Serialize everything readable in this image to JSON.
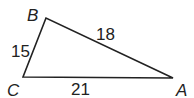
{
  "diagram": {
    "type": "triangle",
    "stroke_color": "#222222",
    "vertices": [
      {
        "name": "B",
        "label": "B",
        "x": 46,
        "y": 18,
        "label_x": 27,
        "label_y": 21
      },
      {
        "name": "C",
        "label": "C",
        "x": 23,
        "y": 77,
        "label_x": 7,
        "label_y": 96
      },
      {
        "name": "A",
        "label": "A",
        "x": 173,
        "y": 78,
        "label_x": 176,
        "label_y": 96
      }
    ],
    "sides": [
      {
        "name": "BC",
        "label": "15",
        "label_x": 11,
        "label_y": 57
      },
      {
        "name": "BA",
        "label": "18",
        "label_x": 96,
        "label_y": 40
      },
      {
        "name": "CA",
        "label": "21",
        "label_x": 71,
        "label_y": 95
      }
    ]
  }
}
